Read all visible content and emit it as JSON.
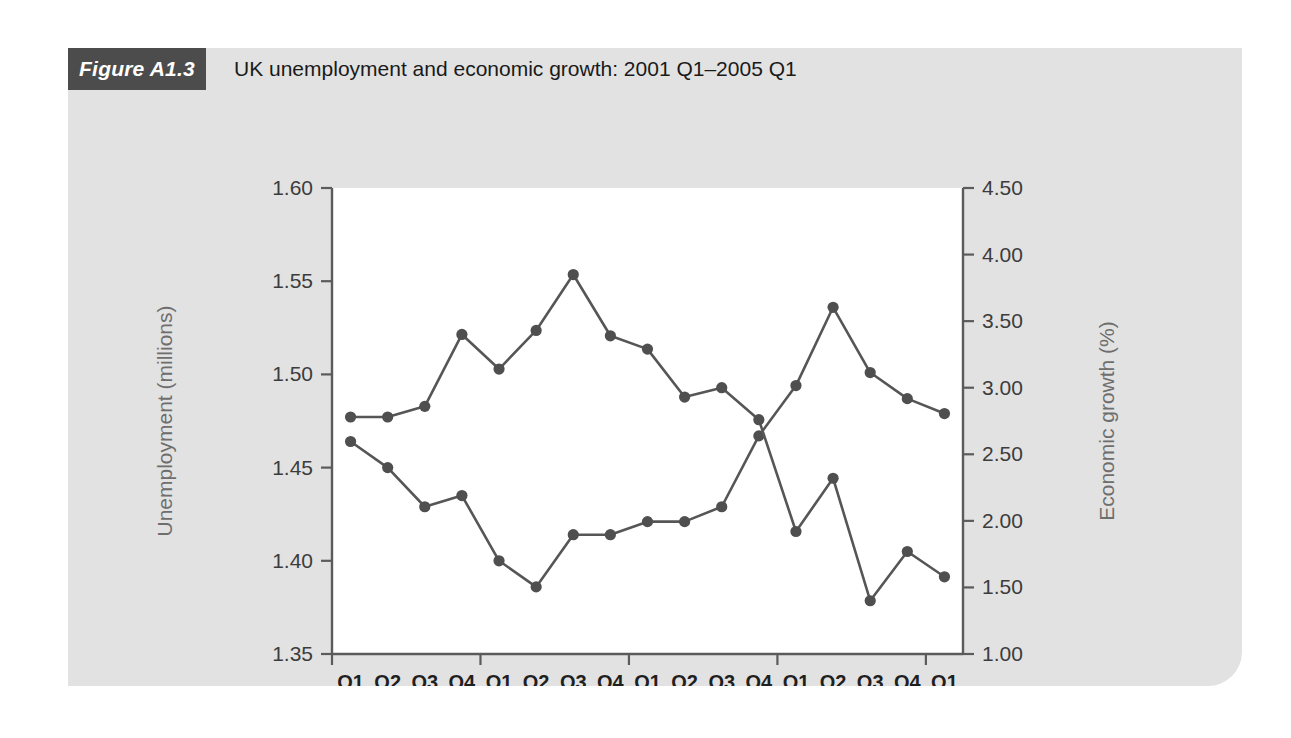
{
  "figure": {
    "badge": "Figure A1.3",
    "title": "UK unemployment and economic growth: 2001 Q1–2005 Q1",
    "panel_bg": "#e2e2e2",
    "badge_bg": "#4c4c4c",
    "plot_bg": "#ffffff",
    "line_color": "#565656",
    "marker_color": "#4f4f4f"
  },
  "chart_data": {
    "type": "line",
    "title": "UK unemployment and economic growth: 2001 Q1–2005 Q1",
    "xlabel": "",
    "grid": false,
    "legend": "none",
    "x": [
      "2001 Q1",
      "2001 Q2",
      "2001 Q3",
      "2001 Q4",
      "2002 Q1",
      "2002 Q2",
      "2002 Q3",
      "2002 Q4",
      "2003 Q1",
      "2003 Q2",
      "2003 Q3",
      "2003 Q4",
      "2004 Q1",
      "2004 Q2",
      "2004 Q3",
      "2004 Q4",
      "2005 Q1"
    ],
    "quarter_labels": [
      "Q1",
      "Q2",
      "Q3",
      "Q4",
      "Q1",
      "Q2",
      "Q3",
      "Q4",
      "Q1",
      "Q2",
      "Q3",
      "Q4",
      "Q1",
      "Q2",
      "Q3",
      "Q4",
      "Q1"
    ],
    "year_labels": [
      "2001",
      "2002",
      "2003",
      "2004",
      "2005"
    ],
    "year_spans": [
      [
        0,
        3
      ],
      [
        4,
        7
      ],
      [
        8,
        11
      ],
      [
        12,
        15
      ],
      [
        16,
        16
      ]
    ],
    "axes": {
      "left": {
        "label": "Unemployment (millions)",
        "ticks": [
          "1.35",
          "1.40",
          "1.45",
          "1.50",
          "1.55",
          "1.60"
        ],
        "tick_values": [
          1.35,
          1.4,
          1.45,
          1.5,
          1.55,
          1.6
        ],
        "lim": [
          1.35,
          1.6
        ]
      },
      "right": {
        "label": "Economic growth (%)",
        "ticks": [
          "1.00",
          "1.50",
          "2.00",
          "2.50",
          "3.00",
          "3.50",
          "4.00",
          "4.50"
        ],
        "tick_values": [
          1.0,
          1.5,
          2.0,
          2.5,
          3.0,
          3.5,
          4.0,
          4.5
        ],
        "lim": [
          1.0,
          4.5
        ]
      }
    },
    "series": [
      {
        "name": "Unemployment (millions)",
        "axis": "left",
        "values": [
          1.464,
          1.45,
          1.429,
          1.435,
          1.4,
          1.386,
          1.414,
          1.414,
          1.421,
          1.421,
          1.429,
          1.467,
          1.494,
          1.536,
          1.501,
          1.487,
          1.479
        ]
      },
      {
        "name": "Economic growth (%)",
        "axis": "right",
        "values": [
          2.78,
          2.78,
          2.86,
          3.4,
          3.14,
          3.43,
          3.85,
          3.39,
          3.29,
          2.93,
          3.0,
          2.76,
          1.92,
          2.32,
          1.4,
          1.77,
          1.58
        ]
      }
    ]
  }
}
